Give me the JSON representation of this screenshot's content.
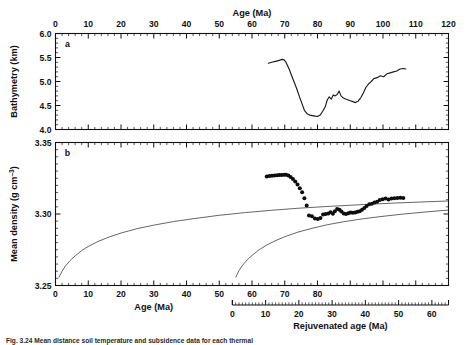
{
  "figure": {
    "caption": "Fig. 3.24  Mean distance soil temperature and subsidence data for each thermal",
    "panels": [
      "a",
      "b"
    ]
  },
  "chart_data": [
    {
      "type": "line",
      "panel_label": "a",
      "title": "Age (Ma)",
      "xlabel": "Age (Ma)",
      "ylabel": "Bathymetry (km)",
      "xlim": [
        0,
        120
      ],
      "ylim": [
        4.0,
        6.0
      ],
      "y_reversed": true,
      "xticks": [
        0,
        10,
        20,
        30,
        40,
        50,
        60,
        70,
        80,
        90,
        100,
        110,
        120
      ],
      "yticks": [
        4.0,
        4.5,
        5.0,
        5.5,
        6.0
      ],
      "ytick_labels": [
        "4.0",
        "4.5",
        "5.0",
        "5.5",
        "6.0"
      ],
      "xtick_labels": [
        "0",
        "10",
        "20",
        "30",
        "40",
        "50",
        "60",
        "70",
        "80",
        "90",
        "100",
        "110",
        "120"
      ],
      "xaxis_position": "top",
      "grid": false,
      "legend": "none",
      "series": [
        {
          "name": "bathymetry",
          "x": [
            65.0,
            66.0,
            67.2,
            68.3,
            69.2,
            69.8,
            70.3,
            70.8,
            71.4,
            72.0,
            72.8,
            73.6,
            74.4,
            75.2,
            76.0,
            76.8,
            77.6,
            78.4,
            79.2,
            80.0,
            80.8,
            81.6,
            82.4,
            83.0,
            83.6,
            84.2,
            84.8,
            85.4,
            86.0,
            86.6,
            87.2,
            87.8,
            88.4,
            89.2,
            90.0,
            90.8,
            91.6,
            92.4,
            93.2,
            94.0,
            94.8,
            95.6,
            96.4,
            97.2,
            98.2,
            99.2,
            100.2,
            101.2,
            102.2,
            103.2,
            104.2,
            105.2,
            106.2,
            107.0
          ],
          "y": [
            5.38,
            5.4,
            5.42,
            5.44,
            5.46,
            5.45,
            5.41,
            5.34,
            5.25,
            5.14,
            5.0,
            4.86,
            4.7,
            4.55,
            4.4,
            4.33,
            4.3,
            4.29,
            4.28,
            4.27,
            4.3,
            4.38,
            4.48,
            4.62,
            4.68,
            4.63,
            4.72,
            4.7,
            4.73,
            4.8,
            4.7,
            4.66,
            4.64,
            4.62,
            4.6,
            4.58,
            4.56,
            4.59,
            4.66,
            4.76,
            4.88,
            4.95,
            5.0,
            5.06,
            5.08,
            5.12,
            5.1,
            5.16,
            5.18,
            5.2,
            5.22,
            5.26,
            5.27,
            5.26
          ]
        }
      ]
    },
    {
      "type": "scatter",
      "panel_label": "b",
      "xlabel": "Age (Ma)",
      "xlabel2": "Rejuvenated age (Ma)",
      "ylabel": "Mean density (g cm⁻³)",
      "xlim": [
        0,
        120
      ],
      "ylim": [
        3.25,
        3.35
      ],
      "yticks": [
        3.25,
        3.3,
        3.35
      ],
      "ytick_labels": [
        "3.25",
        "3.30",
        "3.35"
      ],
      "xticks": [
        0,
        10,
        20,
        30,
        40,
        50,
        60,
        70,
        80
      ],
      "xtick_labels": [
        "0",
        "10",
        "20",
        "30",
        "40",
        "50",
        "60",
        "70",
        "80"
      ],
      "secondary_axis": {
        "label": "Rejuvenated age (Ma)",
        "origin_on_primary": 54,
        "xlim": [
          0,
          65
        ],
        "xticks": [
          0,
          10,
          20,
          30,
          40,
          50,
          60
        ],
        "xtick_labels": [
          "0",
          "10",
          "20",
          "30",
          "40",
          "50",
          "60"
        ]
      },
      "grid": false,
      "legend": "none",
      "series": [
        {
          "name": "reference-curve-primary",
          "type": "line",
          "x": [
            1.0,
            2.0,
            3.0,
            4.5,
            6.0,
            8.0,
            10.0,
            13.0,
            16.0,
            20.0,
            25.0,
            30.0,
            36.0,
            42.0,
            50.0,
            58.0,
            66.0,
            74.0,
            84.0,
            94.0,
            104.0,
            114.0,
            120.0
          ],
          "y": [
            3.2555,
            3.26,
            3.2635,
            3.2676,
            3.2707,
            3.2744,
            3.2773,
            3.2808,
            3.2836,
            3.2867,
            3.2898,
            3.2922,
            3.2947,
            3.2967,
            3.2991,
            3.301,
            3.3026,
            3.304,
            3.3054,
            3.3066,
            3.3077,
            3.3086,
            3.3091
          ]
        },
        {
          "name": "reference-curve-rejuvenated",
          "type": "line",
          "x": [
            55.0,
            56.0,
            57.0,
            58.5,
            60.0,
            62.0,
            64.5,
            67.0,
            70.0,
            74.0,
            78.0,
            83.0,
            88.0,
            94.0,
            100.0,
            106.0,
            112.0,
            118.0,
            120.0
          ],
          "y": [
            3.2556,
            3.2603,
            3.2638,
            3.2679,
            3.271,
            3.2747,
            3.2783,
            3.2812,
            3.2841,
            3.2873,
            3.2898,
            3.2925,
            3.2946,
            3.2967,
            3.2984,
            3.2999,
            3.3012,
            3.3024,
            3.3027
          ]
        },
        {
          "name": "mean-density-points",
          "type": "scatter",
          "x": [
            64.5,
            65.3,
            66.1,
            66.9,
            67.7,
            68.4,
            69.1,
            69.8,
            70.4,
            71.1,
            71.8,
            72.5,
            73.2,
            73.9,
            74.6,
            75.3,
            76.0,
            76.7,
            77.4,
            78.3,
            79.2,
            80.1,
            80.9,
            81.7,
            82.5,
            83.3,
            84.0,
            84.7,
            85.3,
            86.0,
            86.7,
            87.3,
            88.0,
            88.7,
            89.4,
            90.1,
            90.8,
            91.5,
            92.2,
            92.9,
            93.6,
            94.3,
            95.0,
            95.8,
            96.6,
            97.4,
            98.2,
            99.0,
            99.9,
            100.8,
            101.7,
            102.6,
            103.5,
            104.4,
            105.3,
            106.2
          ],
          "y": [
            3.3262,
            3.3265,
            3.3267,
            3.3269,
            3.3271,
            3.3272,
            3.3273,
            3.3274,
            3.3274,
            3.327,
            3.3258,
            3.3244,
            3.3228,
            3.3206,
            3.318,
            3.3152,
            3.311,
            3.306,
            3.299,
            3.2985,
            3.2968,
            3.2965,
            3.2972,
            3.2996,
            3.3,
            3.3004,
            3.3012,
            3.3002,
            3.302,
            3.3035,
            3.303,
            3.3018,
            3.3004,
            3.3,
            3.3005,
            3.301,
            3.3008,
            3.301,
            3.3015,
            3.302,
            3.303,
            3.3042,
            3.3056,
            3.3068,
            3.3072,
            3.308,
            3.3085,
            3.3098,
            3.3104,
            3.3108,
            3.3102,
            3.3108,
            3.311,
            3.3112,
            3.3114,
            3.3112
          ]
        }
      ]
    }
  ],
  "labels": {
    "panel_a": "a",
    "panel_b": "b",
    "age_top": "Age (Ma)",
    "age_bottom": "Age (Ma)",
    "rejuvenated": "Rejuvenated age (Ma)",
    "bathymetry": "Bathymetry (km)",
    "density": "Mean density (g cm",
    "density_sup": "–3",
    "density_tail": ")"
  },
  "colors": {
    "ink": "#111111",
    "curve": "#1a1a1a",
    "dot": "#0d0d0d",
    "background": "#ffffff"
  }
}
